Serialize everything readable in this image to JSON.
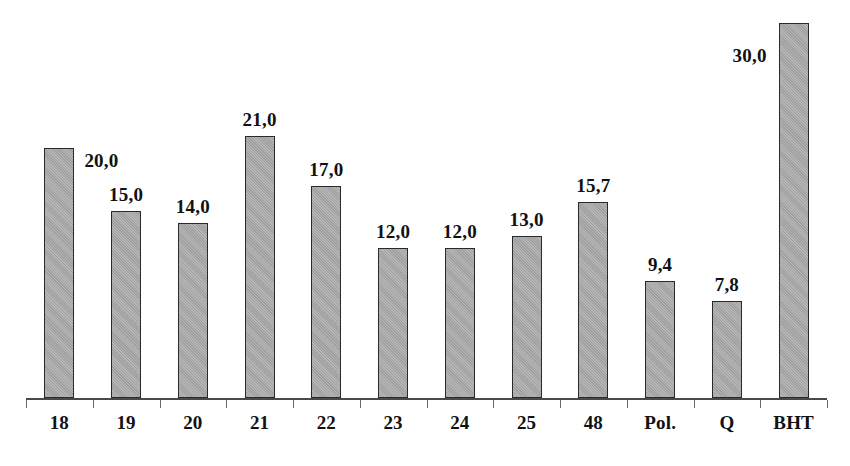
{
  "chart_data": {
    "type": "bar",
    "title": "",
    "subtitle": "",
    "xlabel": "",
    "ylabel": "",
    "ylim": [
      0,
      30
    ],
    "grid": false,
    "legend": null,
    "axis": {
      "visible": true,
      "ticks": 13
    },
    "decimal_separator": ",",
    "categories": [
      "18",
      "19",
      "20",
      "21",
      "22",
      "23",
      "24",
      "25",
      "48",
      "Pol.",
      "Q",
      "BHT"
    ],
    "values": [
      20.0,
      15.0,
      14.0,
      21.0,
      17.0,
      12.0,
      12.0,
      13.0,
      15.7,
      9.4,
      7.8,
      30.0
    ],
    "value_labels": [
      "20,0",
      "15,0",
      "14,0",
      "21,0",
      "17,0",
      "12,0",
      "12,0",
      "13,0",
      "15,7",
      "9,4",
      "7,8",
      "30,0"
    ],
    "label_placement": [
      "side-right",
      "above",
      "above",
      "above",
      "above",
      "above",
      "above",
      "above",
      "above",
      "above",
      "above",
      "side-left"
    ],
    "colors": {
      "bar_fill": "#a8a8a8",
      "bar_stroke": "#2a2a2a",
      "axis": "#4a4a4a",
      "text": "#111111",
      "background": "#ffffff"
    }
  }
}
